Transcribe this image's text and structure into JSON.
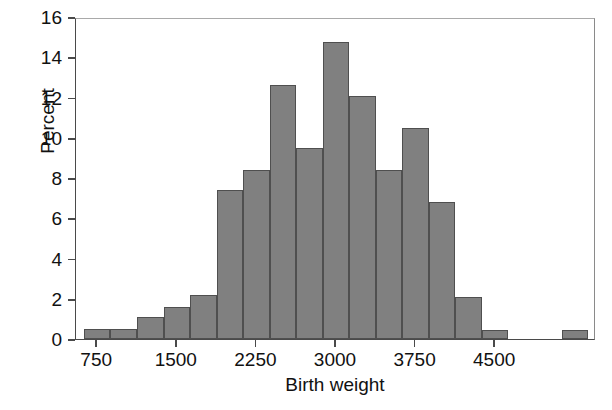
{
  "chart_data": {
    "type": "bar",
    "title": "",
    "xlabel": "Birth weight",
    "ylabel": "Percent",
    "xlim": [
      550,
      5450
    ],
    "ylim": [
      0,
      16
    ],
    "ytick_values": [
      0,
      2,
      4,
      6,
      8,
      10,
      12,
      14,
      16
    ],
    "ytick_labels": [
      "0",
      "2",
      "4",
      "6",
      "8",
      "10",
      "12",
      "14",
      "16"
    ],
    "xtick_values": [
      750,
      1500,
      2250,
      3000,
      3750,
      4500
    ],
    "xtick_labels": [
      "750",
      "1500",
      "2250",
      "3000",
      "3750",
      "4500"
    ],
    "bin_width": 250,
    "grid": false,
    "legend": null,
    "bar_color": "#808080",
    "bar_edge_color": "#4f4f4f",
    "axis_color": "#4a4a4a",
    "bins": [
      {
        "start": 625,
        "end": 875,
        "center": 750,
        "value": 0.5
      },
      {
        "start": 875,
        "end": 1125,
        "center": 1000,
        "value": 0.5
      },
      {
        "start": 1125,
        "end": 1375,
        "center": 1250,
        "value": 1.1
      },
      {
        "start": 1375,
        "end": 1625,
        "center": 1500,
        "value": 1.6
      },
      {
        "start": 1625,
        "end": 1875,
        "center": 1750,
        "value": 2.2
      },
      {
        "start": 1875,
        "end": 2125,
        "center": 2000,
        "value": 7.4
      },
      {
        "start": 2125,
        "end": 2375,
        "center": 2250,
        "value": 8.4
      },
      {
        "start": 2375,
        "end": 2625,
        "center": 2500,
        "value": 12.6
      },
      {
        "start": 2625,
        "end": 2875,
        "center": 2750,
        "value": 9.5
      },
      {
        "start": 2875,
        "end": 3125,
        "center": 3000,
        "value": 14.75
      },
      {
        "start": 3125,
        "end": 3375,
        "center": 3250,
        "value": 12.1
      },
      {
        "start": 3375,
        "end": 3625,
        "center": 3500,
        "value": 8.4
      },
      {
        "start": 3625,
        "end": 3875,
        "center": 3750,
        "value": 10.5
      },
      {
        "start": 3875,
        "end": 4125,
        "center": 4000,
        "value": 6.8
      },
      {
        "start": 4125,
        "end": 4375,
        "center": 4250,
        "value": 2.1
      },
      {
        "start": 4375,
        "end": 4625,
        "center": 4500,
        "value": 0.45
      },
      {
        "start": 4625,
        "end": 4875,
        "center": 4750,
        "value": 0.0
      },
      {
        "start": 4875,
        "end": 5125,
        "center": 5000,
        "value": 0.0
      },
      {
        "start": 5125,
        "end": 5375,
        "center": 5250,
        "value": 0.45
      }
    ]
  }
}
